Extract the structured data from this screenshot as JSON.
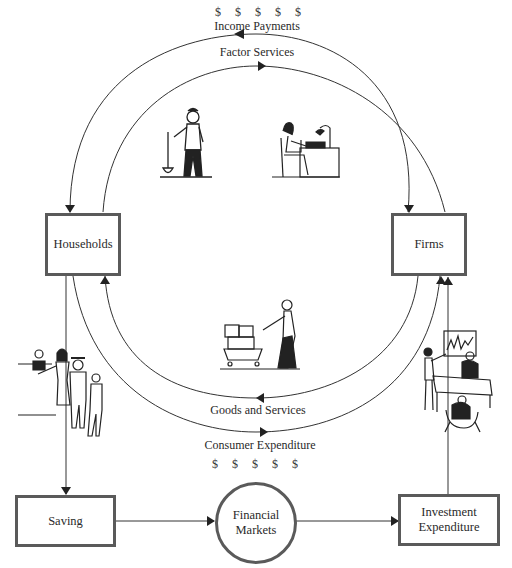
{
  "diagram": {
    "type": "circular-flow",
    "nodes": {
      "households": "Households",
      "firms": "Firms",
      "saving": "Saving",
      "financial_markets_line1": "Financial",
      "financial_markets_line2": "Markets",
      "investment_line1": "Investment",
      "investment_line2": "Expenditure"
    },
    "flows": {
      "income_payments": "Income Payments",
      "factor_services": "Factor Services",
      "goods_and_services": "Goods and Services",
      "consumer_expenditure": "Consumer Expenditure"
    },
    "dollar_signs_top": [
      "$",
      "$",
      "$",
      "$",
      "$"
    ],
    "dollar_signs_bottom": [
      "$",
      "$",
      "$",
      "$",
      "$"
    ],
    "illustrations": [
      "worker-with-shovel",
      "office-worker-at-desk",
      "shopper-with-cart",
      "bank-customers-in-line",
      "business-presentation"
    ],
    "colors": {
      "line": "#2a2a2a",
      "box_border": "#5a5a5a",
      "background": "#ffffff"
    }
  }
}
